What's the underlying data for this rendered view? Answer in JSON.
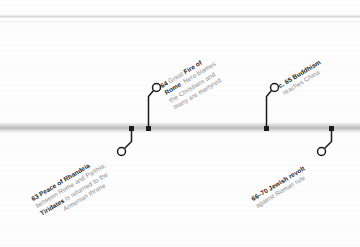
{
  "figure": {
    "type": "historical-timeline",
    "orientation": "horizontal",
    "axis_color": "#b9b9bd",
    "text_color_muted": "#8d8d90",
    "text_color_emphasis": "#1b1b1d"
  },
  "events": [
    {
      "id": "peace-of-rhandeia",
      "position": "below",
      "date": "63",
      "title": "Peace of Rhandeia",
      "lines": [
        {
          "parts": [
            {
              "text": "63 ",
              "bold": true
            },
            {
              "text": "Peace of Rhandeia",
              "bold": true
            }
          ]
        },
        {
          "parts": [
            {
              "text": "between Rome and Parthia;",
              "bold": false
            }
          ]
        },
        {
          "parts": [
            {
              "text": "Tiridates",
              "bold": true
            },
            {
              "text": " is returned to the",
              "bold": false
            }
          ]
        },
        {
          "parts": [
            {
              "text": "Armenian throne",
              "bold": false
            }
          ]
        }
      ]
    },
    {
      "id": "great-fire-of-rome",
      "position": "above",
      "date": "64",
      "title": "Great Fire of Rome",
      "lines": [
        {
          "parts": [
            {
              "text": "64 ",
              "bold": true
            },
            {
              "text": "Great ",
              "bold": false
            },
            {
              "text": "Fire of",
              "bold": true
            }
          ]
        },
        {
          "parts": [
            {
              "text": "Rome",
              "bold": true
            },
            {
              "text": ": Nero blames",
              "bold": false
            }
          ]
        },
        {
          "parts": [
            {
              "text": "the Christians and",
              "bold": false
            }
          ]
        },
        {
          "parts": [
            {
              "text": "many are martyred",
              "bold": false
            }
          ]
        }
      ]
    },
    {
      "id": "buddhism-reaches-china",
      "position": "above",
      "date": "c. 65",
      "title": "Buddhism reaches China",
      "lines": [
        {
          "parts": [
            {
              "text": "c. 65 Buddhism",
              "bold": true
            }
          ]
        },
        {
          "parts": [
            {
              "text": "reaches China",
              "bold": false
            }
          ]
        }
      ]
    },
    {
      "id": "jewish-revolt",
      "position": "below",
      "date": "66–70",
      "title": "Jewish revolt against Roman rule",
      "lines": [
        {
          "parts": [
            {
              "text": "66–70 Jewish revolt",
              "bold": true
            }
          ]
        },
        {
          "parts": [
            {
              "text": "against Roman rule",
              "bold": false
            }
          ]
        }
      ]
    }
  ]
}
